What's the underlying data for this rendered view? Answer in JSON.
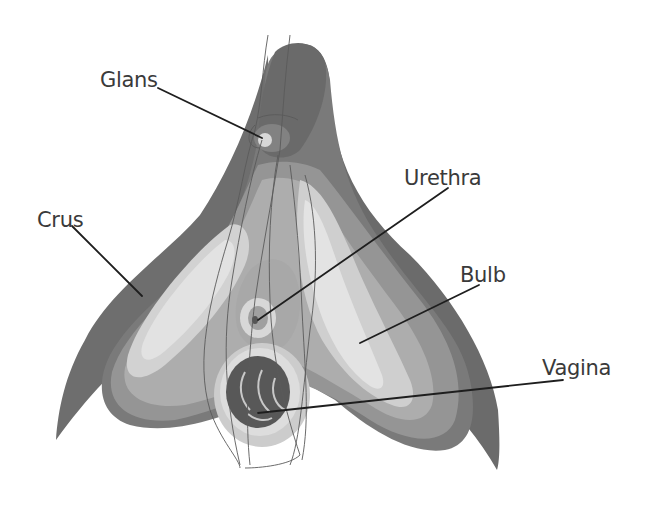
{
  "diagram": {
    "title": "",
    "style": "grayscale anatomical illustration",
    "colors": {
      "background": "#ffffff",
      "outer_dark": "#6b6b6b",
      "mid_dark": "#858585",
      "mid": "#a3a3a3",
      "mid_light": "#bdbdbd",
      "light": "#d6d6d6",
      "lightest": "#e4e4e4",
      "vaginal_opening": "#555555",
      "label_text": "#3a3a3a",
      "leader_line": "#1e1e1e"
    },
    "labels": [
      {
        "id": "glans",
        "text": "Glans"
      },
      {
        "id": "urethra",
        "text": "Urethra"
      },
      {
        "id": "crus",
        "text": "Crus"
      },
      {
        "id": "bulb",
        "text": "Bulb"
      },
      {
        "id": "vagina",
        "text": "Vagina"
      }
    ]
  }
}
